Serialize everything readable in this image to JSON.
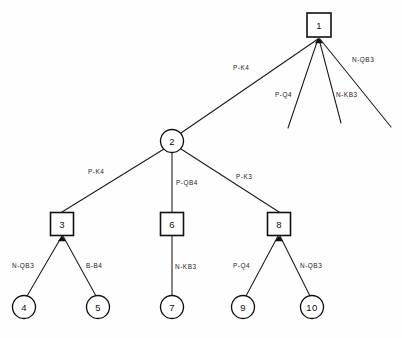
{
  "diagram": {
    "type": "tree",
    "background_color": "#fefefe",
    "line_color": "#111111",
    "node_fill": "#ffffff",
    "nodes": [
      {
        "id": "n1",
        "label": "1",
        "shape": "square",
        "cx": 319,
        "cy": 25,
        "size": 24
      },
      {
        "id": "n2",
        "label": "2",
        "shape": "circle",
        "cx": 172,
        "cy": 141,
        "r": 11.5
      },
      {
        "id": "n3",
        "label": "3",
        "shape": "square",
        "cx": 62,
        "cy": 224,
        "size": 23
      },
      {
        "id": "n6",
        "label": "6",
        "shape": "square",
        "cx": 172,
        "cy": 224,
        "size": 23
      },
      {
        "id": "n8",
        "label": "8",
        "shape": "square",
        "cx": 279,
        "cy": 224,
        "size": 23
      },
      {
        "id": "n4",
        "label": "4",
        "shape": "circle",
        "cx": 24,
        "cy": 307,
        "r": 11.5
      },
      {
        "id": "n5",
        "label": "5",
        "shape": "circle",
        "cx": 98,
        "cy": 307,
        "r": 11.5
      },
      {
        "id": "n7",
        "label": "7",
        "shape": "circle",
        "cx": 172,
        "cy": 307,
        "r": 11.5
      },
      {
        "id": "n9",
        "label": "9",
        "shape": "circle",
        "cx": 243,
        "cy": 307,
        "r": 11.5
      },
      {
        "id": "n10",
        "label": "10",
        "shape": "circle",
        "cx": 312,
        "cy": 307,
        "r": 11.5
      }
    ],
    "edges": [
      {
        "id": "e1",
        "from": "n1",
        "to": "n2",
        "label": "P-K4",
        "x1": 318,
        "y1": 39,
        "x2": 181,
        "y2": 133,
        "lx": 233,
        "ly": 70,
        "terminal": false
      },
      {
        "id": "e2",
        "from": "n1",
        "to": null,
        "label": "P-Q4",
        "x1": 318,
        "y1": 39,
        "x2": 288,
        "y2": 128,
        "lx": 275,
        "ly": 97,
        "terminal": true
      },
      {
        "id": "e3",
        "from": "n1",
        "to": null,
        "label": "N-KB3",
        "x1": 319,
        "y1": 39,
        "x2": 341,
        "y2": 123,
        "lx": 336,
        "ly": 97,
        "terminal": true
      },
      {
        "id": "e4",
        "from": "n1",
        "to": null,
        "label": "N-QB3",
        "x1": 320,
        "y1": 39,
        "x2": 391,
        "y2": 127,
        "lx": 352,
        "ly": 62,
        "terminal": true
      },
      {
        "id": "e5",
        "from": "n2",
        "to": "n3",
        "label": "P-K4",
        "x1": 164,
        "y1": 149,
        "x2": 62,
        "y2": 212,
        "lx": 88,
        "ly": 174,
        "terminal": false
      },
      {
        "id": "e6",
        "from": "n2",
        "to": "n6",
        "label": "P-QB4",
        "x1": 172,
        "y1": 153,
        "x2": 172,
        "y2": 212,
        "lx": 176,
        "ly": 185,
        "terminal": false
      },
      {
        "id": "e7",
        "from": "n2",
        "to": "n8",
        "label": "P-K3",
        "x1": 181,
        "y1": 149,
        "x2": 279,
        "y2": 212,
        "lx": 236,
        "ly": 179,
        "terminal": false
      },
      {
        "id": "e8",
        "from": "n3",
        "to": "n4",
        "label": "N-QB3",
        "x1": 62,
        "y1": 236,
        "x2": 27,
        "y2": 296,
        "lx": 12,
        "ly": 268,
        "terminal": false
      },
      {
        "id": "e9",
        "from": "n3",
        "to": "n5",
        "label": "B-B4",
        "x1": 63,
        "y1": 236,
        "x2": 96,
        "y2": 296,
        "lx": 86,
        "ly": 268,
        "terminal": false
      },
      {
        "id": "e10",
        "from": "n6",
        "to": "n7",
        "label": "N-KB3",
        "x1": 172,
        "y1": 236,
        "x2": 172,
        "y2": 296,
        "lx": 175,
        "ly": 269,
        "terminal": false
      },
      {
        "id": "e11",
        "from": "n8",
        "to": "n9",
        "label": "P-Q4",
        "x1": 278,
        "y1": 236,
        "x2": 246,
        "y2": 296,
        "lx": 233,
        "ly": 268,
        "terminal": false
      },
      {
        "id": "e12",
        "from": "n8",
        "to": "n10",
        "label": "N-QB3",
        "x1": 280,
        "y1": 236,
        "x2": 310,
        "y2": 296,
        "lx": 300,
        "ly": 268,
        "terminal": false
      }
    ],
    "arrowheads": [
      {
        "id": "a1",
        "at": "n1",
        "x": 319,
        "y": 38
      },
      {
        "id": "a2",
        "at": "n3",
        "x": 62,
        "y": 236
      },
      {
        "id": "a3",
        "at": "n8",
        "x": 279,
        "y": 236
      }
    ]
  }
}
